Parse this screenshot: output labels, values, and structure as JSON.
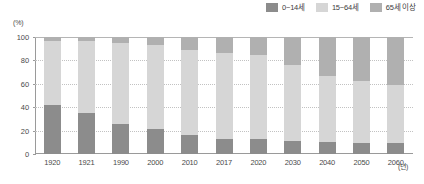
{
  "chart_data": {
    "type": "bar",
    "stacked": true,
    "stack_mode": "percent",
    "title": "",
    "xlabel": "(년)",
    "ylabel": "(%)",
    "ylim": [
      0,
      100
    ],
    "yticks": [
      0,
      20,
      40,
      60,
      80,
      100
    ],
    "ytick_labels": [
      "0",
      "20",
      "40",
      "60",
      "80",
      "100"
    ],
    "grid": true,
    "legend_position": "top-right",
    "categories": [
      "1920",
      "1921",
      "1990",
      "2000",
      "2010",
      "2017",
      "2020",
      "2030",
      "2040",
      "2050",
      "2060"
    ],
    "series": [
      {
        "name": "0~14세",
        "color": "#8c8c8c",
        "values": [
          42,
          35,
          26,
          21,
          16,
          13,
          13,
          11,
          10,
          9,
          9
        ]
      },
      {
        "name": "15~64세",
        "color": "#d6d6d6",
        "values": [
          55,
          62,
          69,
          72,
          73,
          73,
          72,
          65,
          57,
          53,
          50
        ]
      },
      {
        "name": "65세 이상",
        "color": "#b0b0b0",
        "values": [
          3,
          3,
          5,
          7,
          11,
          14,
          15,
          24,
          33,
          38,
          41
        ]
      }
    ]
  },
  "axes": {
    "y_unit": "(%)",
    "x_unit": "(년)"
  },
  "colors": {
    "series_0_14": "#8c8c8c",
    "series_15_64": "#d6d6d6",
    "series_65_plus": "#b0b0b0",
    "axis": "#9a9a9a",
    "grid": "#c2c2c2",
    "text": "#4a4a4a",
    "background": "#ffffff"
  }
}
